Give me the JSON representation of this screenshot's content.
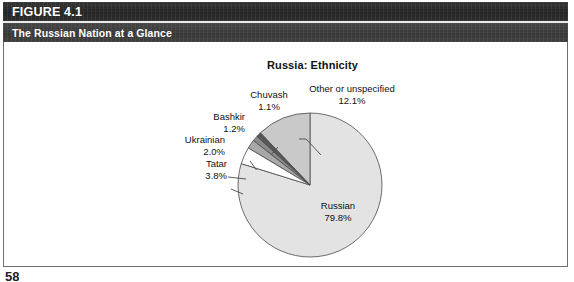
{
  "figure": {
    "number_label": "FIGURE 4.1",
    "subtitle_label": "The Russian Nation at a Glance"
  },
  "page_number": "58",
  "colors": {
    "band_number_bg": "#2a2a2a",
    "band_subtitle_bg": "#3b3b3b",
    "band_rule": "#e9e9e9",
    "frame_border": "#6e6e6e",
    "text": "#111111",
    "slice_russian": "#e3e3e3",
    "slice_other": "#c9c9c9",
    "slice_tatar": "#ffffff",
    "slice_ukrainian": "#a8a8a8",
    "slice_bashkir": "#8a8a8a",
    "slice_chuvash": "#585858",
    "slice_stroke": "#4a4a4a",
    "leader_line": "#4a4a4a"
  },
  "chart_data": {
    "type": "pie",
    "title": "Russia: Ethnicity",
    "xlabel": "",
    "ylabel": "",
    "legend_position": "none",
    "grid": false,
    "labels": [
      "Russian",
      "Other or unspecified",
      "Tatar",
      "Ukrainian",
      "Bashkir",
      "Chuvash"
    ],
    "values": [
      79.8,
      12.1,
      3.8,
      2.0,
      1.2,
      1.1
    ],
    "value_labels": [
      "79.8%",
      "12.1%",
      "3.8%",
      "2.0%",
      "1.2%",
      "1.1%"
    ],
    "slices": [
      {
        "name": "Russian",
        "value": 79.8,
        "value_label": "79.8%",
        "color": "#e3e3e3",
        "label_position": "inside"
      },
      {
        "name": "Other or unspecified",
        "value": 12.1,
        "value_label": "12.1%",
        "color": "#c9c9c9",
        "label_position": "outside-top-right"
      },
      {
        "name": "Tatar",
        "value": 3.8,
        "value_label": "3.8%",
        "color": "#ffffff",
        "label_position": "outside-left"
      },
      {
        "name": "Ukrainian",
        "value": 2.0,
        "value_label": "2.0%",
        "color": "#a8a8a8",
        "label_position": "outside-left"
      },
      {
        "name": "Bashkir",
        "value": 1.2,
        "value_label": "1.2%",
        "color": "#8a8a8a",
        "label_position": "outside-left"
      },
      {
        "name": "Chuvash",
        "value": 1.1,
        "value_label": "1.1%",
        "color": "#585858",
        "label_position": "outside-top"
      }
    ],
    "units": "percent",
    "total": 100.0
  }
}
